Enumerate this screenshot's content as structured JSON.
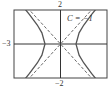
{
  "chart_data": {
    "type": "line",
    "title": "",
    "annotation": "C = −1",
    "xlabel": "",
    "ylabel": "",
    "xlim": [
      -3,
      3
    ],
    "ylim": [
      -2,
      2
    ],
    "tick_labels": {
      "x_min": "−3",
      "y_max": "2",
      "y_min": "−2"
    },
    "grid": false,
    "legend": null,
    "series": [
      {
        "name": "hyperbola x^2 - y^2 = 1 (right branch)",
        "style": "solid",
        "x": [
          3.0,
          2.5,
          2.0,
          1.5,
          1.2,
          1.0,
          1.2,
          1.5,
          2.0,
          2.5,
          3.0
        ],
        "y": [
          -2.83,
          -2.29,
          -1.73,
          -1.12,
          -0.66,
          0.0,
          0.66,
          1.12,
          1.73,
          2.29,
          2.83
        ]
      },
      {
        "name": "hyperbola x^2 - y^2 = 1 (left branch)",
        "style": "solid",
        "x": [
          -3.0,
          -2.5,
          -2.0,
          -1.5,
          -1.2,
          -1.0,
          -1.2,
          -1.5,
          -2.0,
          -2.5,
          -3.0
        ],
        "y": [
          -2.83,
          -2.29,
          -1.73,
          -1.12,
          -0.66,
          0.0,
          0.66,
          1.12,
          1.73,
          2.29,
          2.83
        ]
      },
      {
        "name": "asymptote y = x",
        "style": "dashed",
        "x": [
          -3,
          3
        ],
        "y": [
          -3,
          3
        ]
      },
      {
        "name": "asymptote y = -x",
        "style": "dashed",
        "x": [
          -3,
          3
        ],
        "y": [
          3,
          -3
        ]
      }
    ]
  },
  "colors": {
    "curve": "#555555",
    "axis": "#333333",
    "frame": "#444444"
  }
}
